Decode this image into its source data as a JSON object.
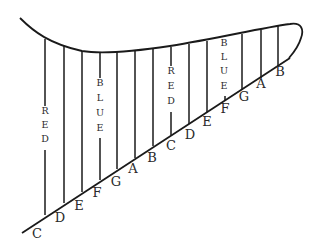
{
  "diagram": {
    "base_labels": [
      {
        "text": "C",
        "x": 37,
        "y": 238
      },
      {
        "text": "D",
        "x": 60,
        "y": 222
      },
      {
        "text": "E",
        "x": 79,
        "y": 210
      },
      {
        "text": "F",
        "x": 97,
        "y": 197
      },
      {
        "text": "G",
        "x": 116,
        "y": 186
      },
      {
        "text": "A",
        "x": 133,
        "y": 173
      },
      {
        "text": "B",
        "x": 152,
        "y": 162
      },
      {
        "text": "C",
        "x": 171,
        "y": 150
      },
      {
        "text": "D",
        "x": 190,
        "y": 139
      },
      {
        "text": "E",
        "x": 207,
        "y": 126
      },
      {
        "text": "F",
        "x": 225,
        "y": 113
      },
      {
        "text": "G",
        "x": 244,
        "y": 101
      },
      {
        "text": "A",
        "x": 261,
        "y": 88
      },
      {
        "text": "B",
        "x": 280,
        "y": 76
      }
    ],
    "color_words": [
      {
        "text": "RED",
        "x": 45,
        "letters_y": [
          114,
          128,
          142
        ]
      },
      {
        "text": "BLUE",
        "x": 100,
        "letters_y": [
          86,
          101,
          116,
          131
        ]
      },
      {
        "text": "RED",
        "x": 171,
        "letters_y": [
          74,
          89,
          104
        ]
      },
      {
        "text": "BLUE",
        "x": 224,
        "letters_y": [
          46,
          60,
          74,
          89
        ]
      }
    ],
    "vertical_lines": [
      {
        "x": 45,
        "top": 39,
        "bottom": 215,
        "gap": [
          106,
          150
        ]
      },
      {
        "x": 64,
        "top": 46,
        "bottom": 203
      },
      {
        "x": 82,
        "top": 51,
        "bottom": 192
      },
      {
        "x": 100,
        "top": 52,
        "bottom": 180,
        "gap": [
          78,
          138
        ]
      },
      {
        "x": 117,
        "top": 52,
        "bottom": 169
      },
      {
        "x": 135,
        "top": 51,
        "bottom": 158
      },
      {
        "x": 153,
        "top": 49,
        "bottom": 146
      },
      {
        "x": 171,
        "top": 47,
        "bottom": 135,
        "gap": [
          66,
          112
        ]
      },
      {
        "x": 189,
        "top": 44,
        "bottom": 124
      },
      {
        "x": 207,
        "top": 41,
        "bottom": 112
      },
      {
        "x": 225,
        "top": 38,
        "bottom": 101,
        "gap": [
          36,
          96
        ]
      },
      {
        "x": 242,
        "top": 34,
        "bottom": 90
      },
      {
        "x": 261,
        "top": 30,
        "bottom": 78
      },
      {
        "x": 278,
        "top": 25,
        "bottom": 66
      }
    ],
    "colors": {
      "ink": "#1a1a1a",
      "background": "#ffffff"
    }
  }
}
